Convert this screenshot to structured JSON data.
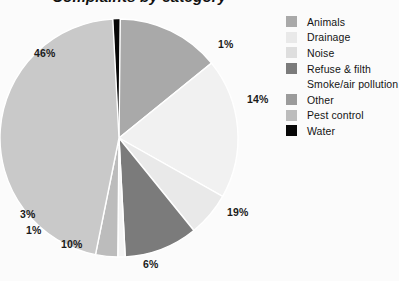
{
  "header": {
    "title": "Complaints by category",
    "clipped": true
  },
  "chart_data": {
    "type": "pie",
    "title": "Complaints by category",
    "legend_position": "right",
    "start_angle": -3,
    "direction": "clockwise",
    "labels": [
      "Water",
      "Animals",
      "Smoke/air pollution",
      "Drainage",
      "Refuse & filth",
      "Other",
      "Pest control",
      "Noise"
    ],
    "values": [
      1,
      14,
      19,
      6,
      10,
      1,
      3,
      46
    ],
    "value_labels": [
      "1%",
      "14%",
      "19%",
      "6%",
      "10%",
      "1%",
      "3%",
      "46%"
    ],
    "colors": [
      "#070707",
      "#a9a9a9",
      "#f1f1f1",
      "#e9e9e9",
      "#7b7b7b",
      "#f4f4f4",
      "#bcbcbc",
      "#c9c9c9"
    ],
    "total": 100,
    "units": "percent"
  },
  "pie_labels": [
    {
      "text": "1%",
      "x": 218,
      "y": 29
    },
    {
      "text": "14%",
      "x": 247,
      "y": 84
    },
    {
      "text": "19%",
      "x": 227,
      "y": 197
    },
    {
      "text": "6%",
      "x": 143,
      "y": 249
    },
    {
      "text": "10%",
      "x": 61,
      "y": 229
    },
    {
      "text": "1%",
      "x": 26,
      "y": 215
    },
    {
      "text": "3%",
      "x": 20,
      "y": 199
    },
    {
      "text": "46%",
      "x": 34,
      "y": 38
    }
  ],
  "legend": {
    "items": [
      {
        "label": "Animals",
        "color": "#a9a9a9",
        "show_swatch": true
      },
      {
        "label": "Drainage",
        "color": "#e9e9e9",
        "show_swatch": true
      },
      {
        "label": "Noise",
        "color": "#dedede",
        "show_swatch": true
      },
      {
        "label": "Refuse & filth",
        "color": "#7b7b7b",
        "show_swatch": true
      },
      {
        "label": "Smoke/air pollution",
        "color": "#fbfbfb",
        "show_swatch": false
      },
      {
        "label": "Other",
        "color": "#9b9b9b",
        "show_swatch": true
      },
      {
        "label": "Pest control",
        "color": "#bcbcbc",
        "show_swatch": true
      },
      {
        "label": "Water",
        "color": "#070707",
        "show_swatch": true
      }
    ]
  }
}
